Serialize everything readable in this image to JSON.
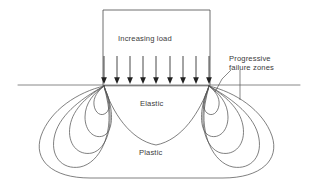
{
  "figure": {
    "type": "engineering-diagram",
    "background_color": "#ffffff",
    "line_color": "#555555",
    "text_color": "#3b3b3b",
    "width": 312,
    "height": 190
  },
  "labels": {
    "increasing_load": "Increasing load",
    "progressive_failure_line1": "Progressive",
    "progressive_failure_line2": "failure zones",
    "elastic": "Elastic",
    "plastic": "Plastic"
  },
  "footing": {
    "left_x": 103,
    "right_x": 210,
    "top_y": 10,
    "base_y": 85
  },
  "ground_line": {
    "start_x": 18,
    "end_x": 300,
    "y": 85
  },
  "load_arrows": {
    "count": 9,
    "top_y": 56,
    "tip_y": 84,
    "x_positions": [
      104,
      117,
      130,
      143,
      156,
      170,
      183,
      196,
      209
    ]
  },
  "zones": [
    {
      "name": "elastic",
      "label": "Elastic"
    },
    {
      "name": "plastic",
      "label": "Plastic"
    },
    {
      "name": "progressive-failure-left",
      "label": "Progressive failure zones"
    },
    {
      "name": "progressive-failure-right",
      "label": "Progressive failure zones"
    }
  ],
  "bulb_contours": {
    "left_origin_x": 104,
    "right_origin_x": 209,
    "origin_y": 85,
    "contours_per_side": 4
  },
  "outer_plastic_boundary": {
    "left_x": 38,
    "right_x": 272,
    "bottom_y": 178
  }
}
